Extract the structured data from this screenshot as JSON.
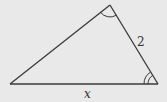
{
  "diagram": {
    "type": "triangle",
    "background": "#e9e9e9",
    "line_color": "#3a3a3a",
    "vertices": {
      "left": [
        10,
        84
      ],
      "top": [
        110,
        5
      ],
      "right": [
        158,
        84
      ]
    },
    "labels": {
      "right_side": "2",
      "base": "x"
    },
    "angle_marks": {
      "top": "single-arc",
      "bottom_right": "double-arc"
    }
  }
}
